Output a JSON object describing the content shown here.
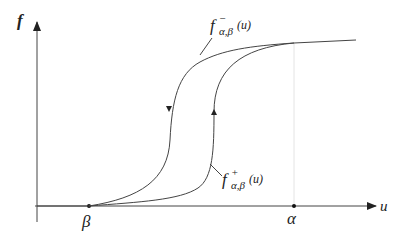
{
  "diagram": {
    "type": "hysteresis-loop",
    "axes": {
      "y_label": "f",
      "x_label": "u"
    },
    "points": {
      "beta": "β",
      "alpha": "α"
    },
    "curves": {
      "lower": {
        "main": "f",
        "sup": "+",
        "sub": "α,β",
        "arg": "(u)",
        "direction": "up"
      },
      "upper": {
        "main": "f",
        "sup": "−",
        "sub": "α,β",
        "arg": "(u)",
        "direction": "down"
      }
    },
    "colors": {
      "line": "#333333",
      "guide": "#dddddd"
    }
  }
}
